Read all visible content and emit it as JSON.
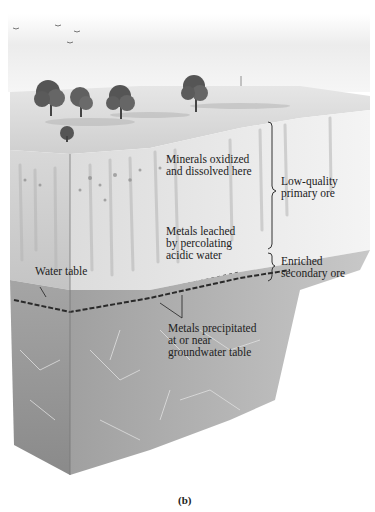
{
  "figure": {
    "caption": "(b)",
    "labels": {
      "minerals_oxidized": "Minerals oxidized\nand dissolved here",
      "metals_leached": "Metals leached\nby percolating\nacidic water",
      "water_table": "Water table",
      "metals_precipitated": "Metals precipitated\nat or near\ngroundwater table",
      "low_quality_ore": "Low-quality\nprimary ore",
      "enriched_ore": "Enriched\nsecondary ore"
    },
    "zones": [
      {
        "name": "surface",
        "description": "grassland with trees"
      },
      {
        "name": "oxidized-leached-zone",
        "description": "Low-quality primary ore"
      },
      {
        "name": "enrichment-zone",
        "description": "Enriched secondary ore"
      },
      {
        "name": "bedrock",
        "description": "fractured primary rock"
      }
    ],
    "colors": {
      "sky": "#f3f3f3",
      "surface": "#dcdcdc",
      "upper_zone": "#d6d6d6",
      "lower_zone": "#9a9a9a",
      "text": "#222222"
    }
  }
}
